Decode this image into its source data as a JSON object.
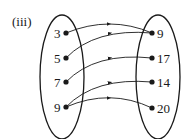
{
  "label": "(iii)",
  "domain_set": [
    {
      "value": "3",
      "x": 66,
      "y": 33
    },
    {
      "value": "5",
      "x": 66,
      "y": 58
    },
    {
      "value": "7",
      "x": 66,
      "y": 82
    },
    {
      "value": "9",
      "x": 66,
      "y": 107
    }
  ],
  "codomain_set": [
    {
      "value": "9",
      "x": 152,
      "y": 33
    },
    {
      "value": "17",
      "x": 152,
      "y": 58
    },
    {
      "value": "14",
      "x": 152,
      "y": 82
    },
    {
      "value": "20",
      "x": 152,
      "y": 108
    }
  ],
  "mappings": [
    {
      "from": "3",
      "to": "9"
    },
    {
      "from": "5",
      "to": "9"
    },
    {
      "from": "7",
      "to": "17"
    },
    {
      "from": "9",
      "to": "14"
    },
    {
      "from": "9",
      "to": "20"
    }
  ],
  "colors": {
    "ink": "#1a1a1a",
    "background": "#ffffff"
  }
}
